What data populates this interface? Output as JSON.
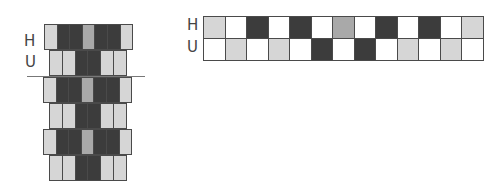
{
  "left_diagram": {
    "labels": {
      "top": "H",
      "bottom": "U"
    },
    "rows": [
      {
        "type": "H",
        "cells": [
          "light",
          "dark",
          "dark",
          "mid",
          "dark",
          "dark",
          "light"
        ]
      },
      {
        "type": "U",
        "cells": [
          "light",
          "light",
          "dark",
          "dark",
          "light",
          "light"
        ]
      },
      {
        "type": "H",
        "cells": [
          "light",
          "dark",
          "dark",
          "mid",
          "dark",
          "dark",
          "light"
        ]
      },
      {
        "type": "U",
        "cells": [
          "light",
          "light",
          "dark",
          "dark",
          "light",
          "light"
        ]
      },
      {
        "type": "H",
        "cells": [
          "light",
          "dark",
          "dark",
          "mid",
          "dark",
          "dark",
          "light"
        ]
      },
      {
        "type": "U",
        "cells": [
          "light",
          "light",
          "dark",
          "dark",
          "light",
          "light"
        ]
      }
    ]
  },
  "right_diagram": {
    "labels": {
      "top": "H",
      "bottom": "U"
    },
    "rows": [
      {
        "type": "H",
        "cells": [
          "light",
          "white",
          "dark",
          "white",
          "dark",
          "white",
          "mid",
          "white",
          "dark",
          "white",
          "dark",
          "white",
          "light"
        ]
      },
      {
        "type": "U",
        "cells": [
          "white",
          "light",
          "white",
          "light",
          "white",
          "dark",
          "white",
          "dark",
          "white",
          "light",
          "white",
          "light",
          "white"
        ]
      }
    ]
  },
  "colors": {
    "light": "#d6d6d6",
    "dark": "#3c3c3c",
    "mid": "#a9a9a9",
    "white": "#ffffff",
    "border": "#4a4a4a"
  }
}
